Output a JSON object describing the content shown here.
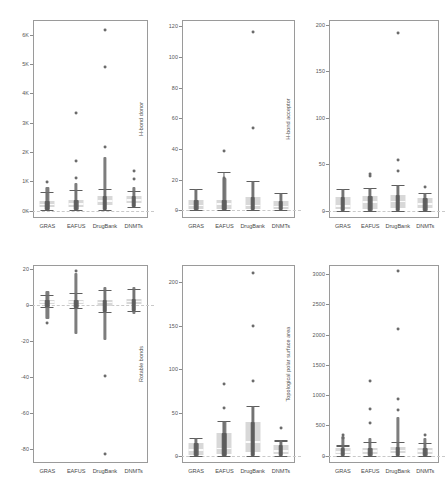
{
  "figure": {
    "type": "boxplot-strip-grid",
    "background": "#ffffff",
    "groups": [
      "GRAS",
      "EAFUS",
      "DrugBank",
      "DNMTs"
    ],
    "rows": 2,
    "cols": 3,
    "point_color": "#6b6b6b",
    "box_color": "#d6d6d6",
    "whisker_color": "#5e5e5e",
    "panel_border_color": "#9a9a9a"
  },
  "chart_data": [
    {
      "id": "molecular-weight",
      "type": "box",
      "title": "",
      "xlabel": "",
      "ylabel": "Molecular weight",
      "categories": [
        "GRAS",
        "EAFUS",
        "DrugBank",
        "DNMTs"
      ],
      "ylim": [
        -250,
        6500
      ],
      "yticks": [
        0,
        1000,
        2000,
        3000,
        4000,
        5000,
        6000
      ],
      "yticklabels": [
        "0K",
        "1K",
        "2K",
        "3K",
        "4K",
        "5K",
        "6K"
      ],
      "grid": false,
      "legend": "none",
      "series": [
        {
          "name": "GRAS",
          "min": 30,
          "q1": 130,
          "median": 210,
          "q3": 330,
          "max": 640,
          "strip_top": 810,
          "outliers": [
            980
          ]
        },
        {
          "name": "EAFUS",
          "min": 30,
          "q1": 140,
          "median": 230,
          "q3": 355,
          "max": 700,
          "strip_top": 960,
          "outliers": [
            1130,
            1710,
            3340
          ]
        },
        {
          "name": "DrugBank",
          "min": 20,
          "q1": 180,
          "median": 330,
          "q3": 490,
          "max": 735,
          "strip_top": 1830,
          "outliers": [
            2180,
            4890,
            6170
          ]
        },
        {
          "name": "DNMTs",
          "min": 120,
          "q1": 270,
          "median": 360,
          "q3": 490,
          "max": 665,
          "strip_top": 790,
          "outliers": [
            1075,
            1340
          ]
        }
      ]
    },
    {
      "id": "h-bond-donor",
      "type": "box",
      "title": "",
      "xlabel": "",
      "ylabel": "H-bond donor",
      "categories": [
        "GRAS",
        "EAFUS",
        "DrugBank",
        "DNMTs"
      ],
      "ylim": [
        -5,
        124
      ],
      "yticks": [
        0,
        20,
        40,
        60,
        80,
        100,
        120
      ],
      "yticklabels": [
        "0",
        "20",
        "40",
        "60",
        "80",
        "100",
        "120"
      ],
      "grid": false,
      "legend": "none",
      "series": [
        {
          "name": "GRAS",
          "min": 0,
          "q1": 1,
          "median": 3,
          "q3": 6.5,
          "max": 14,
          "strip_top": 14,
          "outliers": []
        },
        {
          "name": "EAFUS",
          "min": 0,
          "q1": 1,
          "median": 4,
          "q3": 6.5,
          "max": 25,
          "strip_top": 21,
          "outliers": [
            21,
            38.5
          ]
        },
        {
          "name": "DrugBank",
          "min": 0,
          "q1": 1,
          "median": 3,
          "q3": 8.5,
          "max": 19,
          "strip_top": 19,
          "outliers": [
            53.5,
            116
          ]
        },
        {
          "name": "DNMTs",
          "min": 0,
          "q1": 1,
          "median": 2.5,
          "q3": 6,
          "max": 11.5,
          "strip_top": 11.5,
          "outliers": []
        }
      ]
    },
    {
      "id": "h-bond-acceptor",
      "type": "box",
      "title": "",
      "xlabel": "",
      "ylabel": "H-bond acceptor",
      "categories": [
        "GRAS",
        "EAFUS",
        "DrugBank",
        "DNMTs"
      ],
      "ylim": [
        -8,
        205
      ],
      "yticks": [
        0,
        50,
        100,
        150,
        200
      ],
      "yticklabels": [
        "0",
        "50",
        "100",
        "150",
        "200"
      ],
      "grid": false,
      "legend": "none",
      "series": [
        {
          "name": "GRAS",
          "min": 0,
          "q1": 2,
          "median": 5,
          "q3": 15,
          "max": 23,
          "strip_top": 23,
          "outliers": []
        },
        {
          "name": "EAFUS",
          "min": 0,
          "q1": 2,
          "median": 9,
          "q3": 16,
          "max": 24,
          "strip_top": 24,
          "outliers": [
            37,
            39
          ]
        },
        {
          "name": "DrugBank",
          "min": 0,
          "q1": 3,
          "median": 10,
          "q3": 17,
          "max": 28,
          "strip_top": 28,
          "outliers": [
            43,
            54,
            191
          ]
        },
        {
          "name": "DNMTs",
          "min": 0,
          "q1": 3,
          "median": 7,
          "q3": 13,
          "max": 19,
          "strip_top": 19,
          "outliers": [
            25
          ]
        }
      ]
    },
    {
      "id": "logp",
      "type": "box",
      "title": "",
      "xlabel": "",
      "ylabel": "Log octanol/water partition coefficient",
      "categories": [
        "GRAS",
        "EAFUS",
        "DrugBank",
        "DNMTs"
      ],
      "ylim": [
        -88,
        22
      ],
      "yticks": [
        -80,
        -60,
        -40,
        -20,
        0,
        20
      ],
      "yticklabels": [
        "-80",
        "-60",
        "-40",
        "-20",
        "0",
        "20"
      ],
      "grid": false,
      "legend": "none",
      "series": [
        {
          "name": "GRAS",
          "min": -1.5,
          "q1": 0.3,
          "median": 1.4,
          "q3": 2.4,
          "max": 5.5,
          "strip_top": 7.5,
          "strip_bottom": -8.0,
          "outliers": [
            -10
          ]
        },
        {
          "name": "EAFUS",
          "min": -1.8,
          "q1": 0.2,
          "median": 1.5,
          "q3": 2.8,
          "max": 6.3,
          "strip_top": 17.5,
          "strip_bottom": -16.5,
          "outliers": [
            18.5
          ]
        },
        {
          "name": "DrugBank",
          "min": -4.2,
          "q1": -0.6,
          "median": 1.0,
          "q3": 2.6,
          "max": 8.1,
          "strip_top": 10,
          "strip_bottom": -19.5,
          "outliers": [
            -39.5,
            -83
          ]
        },
        {
          "name": "DNMTs",
          "min": -3.6,
          "q1": 0.5,
          "median": 1.8,
          "q3": 3.3,
          "max": 8.8,
          "strip_top": 10,
          "strip_bottom": -5.5,
          "outliers": []
        }
      ]
    },
    {
      "id": "rotable-bonds",
      "type": "box",
      "title": "",
      "xlabel": "",
      "ylabel": "Rotable bonds",
      "categories": [
        "GRAS",
        "EAFUS",
        "DrugBank",
        "DNMTs"
      ],
      "ylim": [
        -8,
        220
      ],
      "yticks": [
        0,
        50,
        100,
        150,
        200
      ],
      "yticklabels": [
        "0",
        "50",
        "100",
        "150",
        "200"
      ],
      "grid": false,
      "legend": "none",
      "series": [
        {
          "name": "GRAS",
          "min": 0,
          "q1": 1,
          "median": 7,
          "q3": 15,
          "max": 21,
          "strip_top": 21,
          "outliers": []
        },
        {
          "name": "EAFUS",
          "min": 0,
          "q1": 2,
          "median": 9,
          "q3": 27,
          "max": 40,
          "strip_top": 40,
          "outliers": [
            55,
            83
          ]
        },
        {
          "name": "DrugBank",
          "min": 0,
          "q1": 5,
          "median": 16,
          "q3": 39,
          "max": 58,
          "strip_top": 58,
          "outliers": [
            87,
            150,
            211
          ]
        },
        {
          "name": "DNMTs",
          "min": 0,
          "q1": 2,
          "median": 6,
          "q3": 13,
          "max": 18,
          "strip_top": 18,
          "outliers": [
            32
          ]
        }
      ]
    },
    {
      "id": "tpsa",
      "type": "box",
      "title": "",
      "xlabel": "",
      "ylabel": "Topological polar surface area",
      "categories": [
        "GRAS",
        "EAFUS",
        "DrugBank",
        "DNMTs"
      ],
      "ylim": [
        -120,
        3150
      ],
      "yticks": [
        0,
        500,
        1000,
        1500,
        2000,
        2500,
        3000
      ],
      "yticklabels": [
        "0",
        "500",
        "1000",
        "1500",
        "2000",
        "2500",
        "3000"
      ],
      "grid": false,
      "legend": "none",
      "series": [
        {
          "name": "GRAS",
          "min": 0,
          "q1": 25,
          "median": 60,
          "q3": 120,
          "max": 170,
          "strip_top": 330,
          "outliers": [
            300,
            340
          ]
        },
        {
          "name": "EAFUS",
          "min": 0,
          "q1": 30,
          "median": 75,
          "q3": 130,
          "max": 230,
          "strip_top": 300,
          "outliers": [
            545,
            775,
            1230
          ]
        },
        {
          "name": "DrugBank",
          "min": 0,
          "q1": 40,
          "median": 85,
          "q3": 140,
          "max": 230,
          "strip_top": 640,
          "outliers": [
            760,
            935,
            2090,
            3045
          ]
        },
        {
          "name": "DNMTs",
          "min": 0,
          "q1": 35,
          "median": 80,
          "q3": 130,
          "max": 205,
          "strip_top": 300,
          "outliers": [
            345
          ]
        }
      ]
    }
  ]
}
